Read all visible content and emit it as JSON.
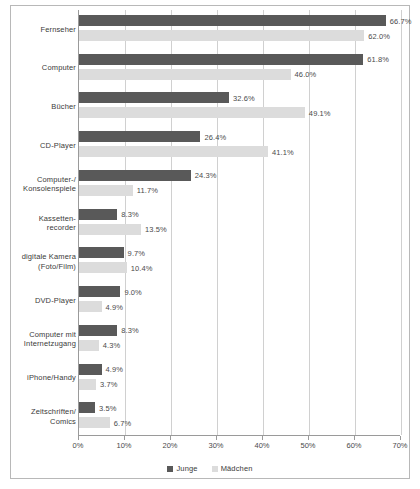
{
  "chart_data": {
    "type": "bar",
    "orientation": "horizontal",
    "title": "",
    "subtitle": "",
    "xlabel": "",
    "ylabel": "",
    "xlim": [
      0,
      70
    ],
    "xtick_labels": [
      "0%",
      "10%",
      "20%",
      "30%",
      "40%",
      "50%",
      "60%",
      "70%"
    ],
    "xticks": [
      0,
      10,
      20,
      30,
      40,
      50,
      60,
      70
    ],
    "grid": true,
    "legend_position": "bottom",
    "value_suffix": "%",
    "categories": [
      "Fernseher",
      "Computer",
      "Bücher",
      "CD-Player",
      "Computer-/\nKonsolenspiele",
      "Kassetten-\nrecorder",
      "digitale Kamera\n(Foto/Film)",
      "DVD-Player",
      "Computer mit\nInternetzugang",
      "iPhone/Handy",
      "Zeitschriften/\nComics"
    ],
    "series": [
      {
        "name": "Junge",
        "color": "#595959",
        "values": [
          66.7,
          61.8,
          32.6,
          26.4,
          24.3,
          8.3,
          9.7,
          9.0,
          8.3,
          4.9,
          3.5
        ],
        "labels": [
          "66.7%",
          "61.8%",
          "32.6%",
          "26.4%",
          "24.3%",
          "8.3%",
          "9.7%",
          "9.0%",
          "8.3%",
          "4.9%",
          "3.5%"
        ]
      },
      {
        "name": "Mädchen",
        "color": "#dcdcdc",
        "values": [
          62.0,
          46.0,
          49.1,
          41.1,
          11.7,
          13.5,
          10.4,
          4.9,
          4.3,
          3.7,
          6.7
        ],
        "labels": [
          "62.0%",
          "46.0%",
          "49.1%",
          "41.1%",
          "11.7%",
          "13.5%",
          "10.4%",
          "4.9%",
          "4.3%",
          "3.7%",
          "6.7%"
        ]
      }
    ]
  },
  "legend": {
    "items": [
      {
        "label": "Junge"
      },
      {
        "label": "Mädchen"
      }
    ]
  }
}
